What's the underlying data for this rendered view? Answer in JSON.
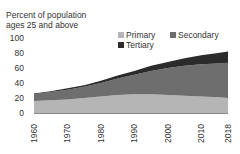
{
  "chart_data": {
    "type": "area",
    "stacked": true,
    "title": "",
    "ylabel": "Percent of population ages 25 and above",
    "ylabel_lines": [
      "Percent of population",
      "ages 25 and above"
    ],
    "xlabel": "",
    "ylim": [
      0,
      100
    ],
    "yticks": [
      0,
      20,
      40,
      60,
      80,
      100
    ],
    "xticks": [
      1960,
      1970,
      1980,
      1990,
      2000,
      2010,
      2018
    ],
    "x": [
      1960,
      1965,
      1970,
      1975,
      1980,
      1985,
      1990,
      1995,
      2000,
      2005,
      2010,
      2015,
      2018
    ],
    "series": [
      {
        "name": "Primary",
        "color": "#b5b5b5",
        "values": [
          16,
          17,
          18,
          20,
          22,
          24,
          25,
          25,
          24,
          23,
          22,
          21,
          20
        ]
      },
      {
        "name": "Secondary",
        "color": "#6e6e6e",
        "values": [
          9,
          11,
          13,
          15,
          18,
          22,
          26,
          31,
          36,
          40,
          43,
          45,
          47
        ]
      },
      {
        "name": "Tertiary",
        "color": "#2b2b2b",
        "values": [
          1,
          1,
          2,
          2,
          3,
          4,
          5,
          7,
          8,
          10,
          12,
          14,
          15
        ]
      }
    ],
    "legend": {
      "position": "top-right",
      "entries": [
        "Primary",
        "Secondary",
        "Tertiary"
      ]
    },
    "grid": false
  },
  "labels": {
    "ylabel_line1": "Percent of population",
    "ylabel_line2": "ages 25 and above",
    "legend_primary": "Primary",
    "legend_secondary": "Secondary",
    "legend_tertiary": "Tertiary"
  }
}
